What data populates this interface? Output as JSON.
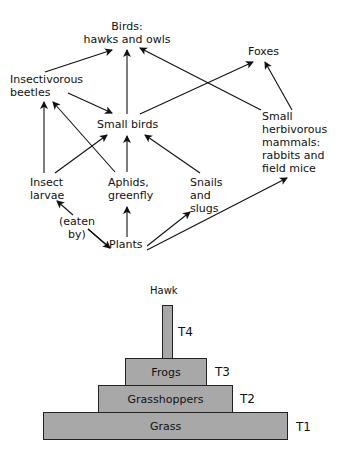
{
  "food_web": {
    "nodes": {
      "birds_line1": "Birds:",
      "birds_line2": "hawks and owls",
      "foxes": "Foxes",
      "beetles_line1": "Insectivorous",
      "beetles_line2": "beetles",
      "small_birds": "Small birds",
      "mammals_line1": "Small",
      "mammals_line2": "herbivorous",
      "mammals_line3": "mammals:",
      "mammals_line4": "rabbits and",
      "mammals_line5": "field mice",
      "larvae_line1": "Insect",
      "larvae_line2": "larvae",
      "aphids_line1": "Aphids,",
      "aphids_line2": "greenfly",
      "snails_line1": "Snails",
      "snails_line2": "and",
      "snails_line3": "slugs",
      "plants": "Plants"
    },
    "annotation_line1": "(eaten",
    "annotation_line2": "by)",
    "edges": [
      [
        "Insectivorous beetles",
        "Birds: hawks and owls"
      ],
      [
        "Small birds",
        "Birds: hawks and owls"
      ],
      [
        "Small herbivorous mammals",
        "Birds: hawks and owls"
      ],
      [
        "Small birds",
        "Foxes"
      ],
      [
        "Small herbivorous mammals",
        "Foxes"
      ],
      [
        "Insectivorous beetles",
        "Small birds"
      ],
      [
        "Insect larvae",
        "Insectivorous beetles"
      ],
      [
        "Aphids, greenfly",
        "Insectivorous beetles"
      ],
      [
        "Insect larvae",
        "Small birds"
      ],
      [
        "Aphids, greenfly",
        "Small birds"
      ],
      [
        "Snails and slugs",
        "Small birds"
      ],
      [
        "Plants",
        "Insect larvae"
      ],
      [
        "Plants",
        "Aphids, greenfly"
      ],
      [
        "Plants",
        "Snails and slugs"
      ],
      [
        "Plants",
        "Small herbivorous mammals"
      ]
    ]
  },
  "pyramid": {
    "top_label": "Hawk",
    "levels": [
      {
        "name": "Grass",
        "trophic": "T1"
      },
      {
        "name": "Grasshoppers",
        "trophic": "T2"
      },
      {
        "name": "Frogs",
        "trophic": "T3"
      },
      {
        "name": "",
        "trophic": "T4"
      }
    ],
    "fill_color": "#a8a8a8"
  }
}
